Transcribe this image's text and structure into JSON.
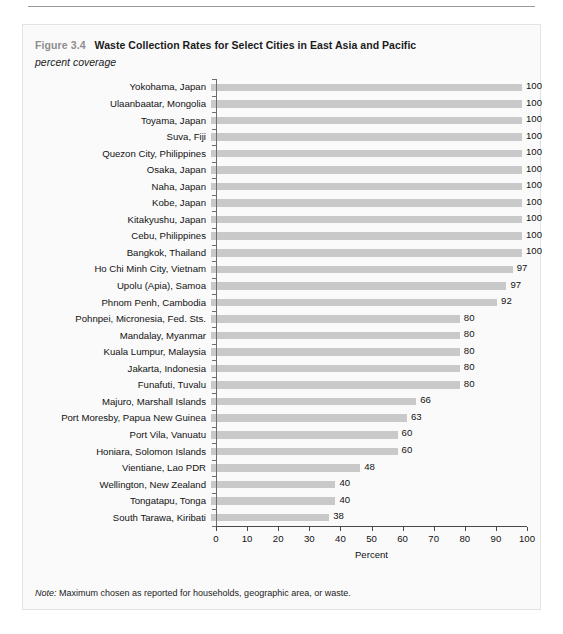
{
  "figure": {
    "label": "Figure 3.4",
    "title": "Waste Collection Rates for Select Cities in East Asia and Pacific",
    "subtitle": "percent coverage",
    "note_prefix": "Note:",
    "note_text": "Maximum chosen as reported for households, geographic area, or waste."
  },
  "colors": {
    "bar": "#c9c9c9",
    "figure_label": "#8d8d8d",
    "text": "#121212",
    "axis": "#4a4a4a",
    "panel_background": "#fafafa"
  },
  "chart_data": {
    "type": "bar",
    "orientation": "horizontal",
    "title": "Waste Collection Rates for Select Cities in East Asia and Pacific",
    "subtitle": "percent coverage",
    "xlabel": "Percent",
    "ylabel": "",
    "xlim": [
      0,
      100
    ],
    "xticks": [
      0,
      10,
      20,
      30,
      40,
      50,
      60,
      70,
      80,
      90,
      100
    ],
    "xticklabels": [
      "0",
      "10",
      "20",
      "30",
      "40",
      "50",
      "60",
      "70",
      "80",
      "90",
      "100"
    ],
    "grid": false,
    "legend": false,
    "data_labels": true,
    "categories": [
      "Yokohama, Japan",
      "Ulaanbaatar, Mongolia",
      "Toyama, Japan",
      "Suva, Fiji",
      "Quezon City, Philippines",
      "Osaka, Japan",
      "Naha, Japan",
      "Kobe, Japan",
      "Kitakyushu, Japan",
      "Cebu, Philippines",
      "Bangkok, Thailand",
      "Ho Chi Minh City, Vietnam",
      "Upolu (Apia), Samoa",
      "Phnom Penh, Cambodia",
      "Pohnpei, Micronesia, Fed. Sts.",
      "Mandalay, Myanmar",
      "Kuala Lumpur, Malaysia",
      "Jakarta, Indonesia",
      "Funafuti, Tuvalu",
      "Majuro, Marshall Islands",
      "Port Moresby, Papua New Guinea",
      "Port Vila, Vanuatu",
      "Honiara, Solomon Islands",
      "Vientiane, Lao PDR",
      "Wellington, New Zealand",
      "Tongatapu, Tonga",
      "South Tarawa, Kiribati"
    ],
    "values": [
      100,
      100,
      100,
      100,
      100,
      100,
      100,
      100,
      100,
      100,
      100,
      97,
      95,
      92,
      80,
      80,
      80,
      80,
      80,
      66,
      63,
      60,
      60,
      48,
      40,
      40,
      38
    ],
    "value_labels": [
      "100",
      "100",
      "100",
      "100",
      "100",
      "100",
      "100",
      "100",
      "100",
      "100",
      "100",
      "97",
      "97",
      "92",
      "80",
      "80",
      "80",
      "80",
      "80",
      "66",
      "63",
      "60",
      "60",
      "48",
      "40",
      "40",
      "38"
    ]
  }
}
